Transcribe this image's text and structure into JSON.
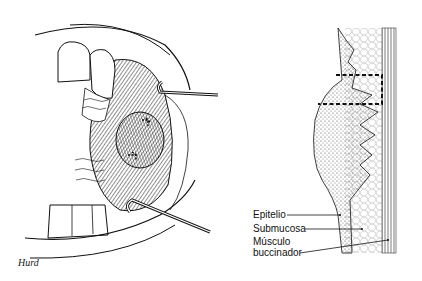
{
  "figure": {
    "left_panel": {
      "description": "Oral cavity view with retractors exposing a buccal mucosa nodule with sutures",
      "signature": "Hurd"
    },
    "right_panel": {
      "description": "Cross-section of buccal mucosa lesion with dashed excision outline",
      "labels": [
        {
          "text": "Epitelio"
        },
        {
          "text": "Submucosa"
        },
        {
          "text": "Músculo"
        },
        {
          "text": "buccinador"
        }
      ]
    },
    "colors": {
      "ink": "#111111",
      "background": "#ffffff",
      "shade": "#555555"
    }
  }
}
